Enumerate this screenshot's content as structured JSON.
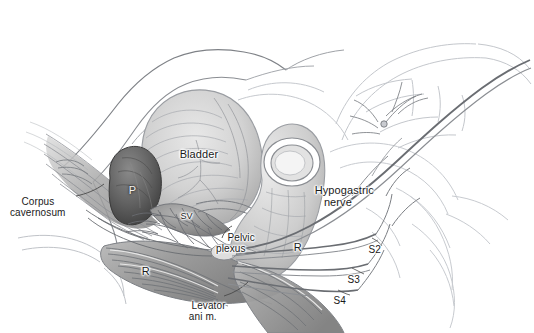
{
  "figure": {
    "type": "anatomical-line-and-tone-illustration",
    "palette": {
      "background": "#ffffff",
      "ink": "#5a5a5a",
      "faint_ink": "#b9bcc2",
      "label_text": "#1a1a1a",
      "bladder_tone": "#cfcfcf",
      "prostate_tone": "#6a6a6a",
      "rectum_tone": "#c8c8c8",
      "muscle_tone": "#a8a8a8",
      "nerve_line": "#7c7c7c"
    },
    "width": 534,
    "height": 333
  },
  "labels": [
    {
      "id": "corpus-cavernosum",
      "text": "Corpus\ncavernosum",
      "x": 10,
      "y": 188,
      "size": "small",
      "align": "left",
      "leader": true
    },
    {
      "id": "bladder",
      "text": "Bladder",
      "x": 167,
      "y": 136,
      "size": "base",
      "align": "left",
      "leader": false
    },
    {
      "id": "prostate",
      "text": "P",
      "x": 116,
      "y": 172,
      "size": "base",
      "align": "left",
      "leader": false
    },
    {
      "id": "seminal-vesicle",
      "text": "SV",
      "x": 170,
      "y": 201,
      "size": "tiny",
      "align": "left",
      "leader": false
    },
    {
      "id": "pelvic-plexus",
      "text": "Pelvic\nplexus",
      "x": 218,
      "y": 222,
      "size": "small",
      "align": "left",
      "leader": true
    },
    {
      "id": "rectum-upper",
      "text": "R",
      "x": 281,
      "y": 230,
      "size": "base",
      "align": "left",
      "leader": false
    },
    {
      "id": "rectum-lower",
      "text": "R",
      "x": 129,
      "y": 254,
      "size": "base",
      "align": "left",
      "leader": false
    },
    {
      "id": "hypogastric-nerve",
      "text": "Hypogastric\nnerve",
      "x": 302,
      "y": 173,
      "size": "base",
      "align": "left",
      "leader": true
    },
    {
      "id": "levator-ani",
      "text": "Levator\nani m.",
      "x": 182,
      "y": 290,
      "size": "small",
      "align": "left",
      "leader": true
    },
    {
      "id": "sacral-s2",
      "text": "S2",
      "x": 357,
      "y": 234,
      "size": "small",
      "align": "left",
      "leader": true
    },
    {
      "id": "sacral-s3",
      "text": "S3",
      "x": 336,
      "y": 264,
      "size": "small",
      "align": "left",
      "leader": true
    },
    {
      "id": "sacral-s4",
      "text": "S4",
      "x": 322,
      "y": 285,
      "size": "small",
      "align": "left",
      "leader": true
    }
  ],
  "structures": [
    {
      "id": "bladder",
      "name": "Bladder",
      "tone": "#cfcfcf"
    },
    {
      "id": "prostate",
      "name": "Prostate",
      "tone": "#6a6a6a"
    },
    {
      "id": "seminal-vesicle",
      "name": "Seminal vesicle",
      "tone": "#8f8f8f"
    },
    {
      "id": "rectum",
      "name": "Rectum",
      "tone": "#c8c8c8"
    },
    {
      "id": "levator-ani-muscle",
      "name": "Levator ani muscle",
      "tone": "#a8a8a8"
    },
    {
      "id": "corpus-cavernosum",
      "name": "Corpus cavernosum",
      "tone": "#b0b0b0"
    },
    {
      "id": "pubic-bone",
      "name": "Pubic bone",
      "tone": "#ffffff"
    },
    {
      "id": "sacrum",
      "name": "Sacrum",
      "tone": "#fbfbfb"
    },
    {
      "id": "hypogastric-nerve",
      "name": "Hypogastric nerve",
      "tone": "#7c7c7c"
    },
    {
      "id": "pelvic-plexus",
      "name": "Pelvic plexus",
      "tone": "#9a9a9a"
    },
    {
      "id": "sacral-roots",
      "name": "Sacral nerve roots S2-S4",
      "tone": "#7c7c7c"
    }
  ]
}
